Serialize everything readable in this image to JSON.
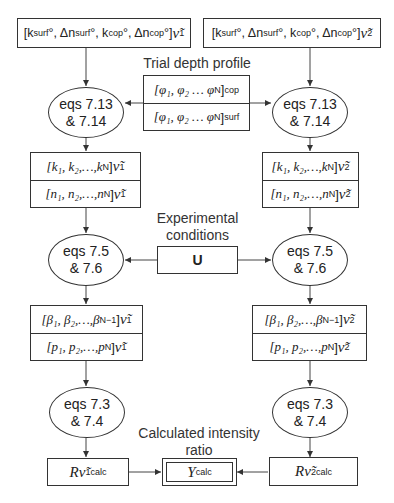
{
  "top_boxes": {
    "left": {
      "params": "[k",
      "sub1": "surf",
      "mid1": "°, Δn",
      "sub2": "surf",
      "mid2": "°, k",
      "sub3": "cop",
      "mid3": "°, Δn",
      "sub4": "cop",
      "end": "°]",
      "wavenumber": "ν̃",
      "wn_sub": "1"
    },
    "right": {
      "params": "[k",
      "sub1": "surf",
      "mid1": "°, Δn",
      "sub2": "surf",
      "mid2": "°, k",
      "sub3": "cop",
      "mid3": "°, Δn",
      "sub4": "cop",
      "end": "°]",
      "wavenumber": "ν̃",
      "wn_sub": "2"
    }
  },
  "trial_depth_profile": {
    "title": "Trial depth profile",
    "rows": [
      {
        "text": "[φ₁, φ₂ … φ",
        "sub_n": "N",
        "close": "]",
        "sub": "cop"
      },
      {
        "text": "[φ₁, φ₂ … φ",
        "sub_n": "N",
        "close": "]",
        "sub": "surf"
      }
    ]
  },
  "ellipses": {
    "eq713": {
      "line1": "eqs 7.13",
      "line2": "& 7.14"
    },
    "eq75": {
      "line1": "eqs 7.5",
      "line2": "& 7.6"
    },
    "eq73": {
      "line1": "eqs 7.3",
      "line2": "& 7.4"
    }
  },
  "optical_constants": {
    "k_row": {
      "text": "[k₁, k₂,…,k",
      "sub": "N",
      "close": "]"
    },
    "n_row": {
      "text": "[n₁, n₂,…,n",
      "sub": "N",
      "close": "]"
    }
  },
  "experimental_conditions": {
    "title_line1": "Experimental",
    "title_line2": "conditions",
    "value": "U"
  },
  "intermediate": {
    "beta_row": {
      "text": "[β₁, β₂,…,β",
      "sub": "N−1",
      "close": "]"
    },
    "p_row": {
      "text": "[p₁, p₂,…,p",
      "sub": "N",
      "close": "]"
    }
  },
  "wavenumbers": {
    "left": {
      "symbol": "ν̃",
      "sub": "1"
    },
    "right": {
      "symbol": "ν̃",
      "sub": "2"
    }
  },
  "results": {
    "left": {
      "R": "R",
      "symbol": "ν̃",
      "sub": "1",
      "sup": "calc"
    },
    "right": {
      "R": "R",
      "symbol": "ν̃",
      "sub": "2",
      "sup": "calc"
    },
    "ratio_title_line1": "Calculated intensity",
    "ratio_title_line2": "ratio",
    "ratio": {
      "Y": "Y",
      "sup": "calc"
    }
  }
}
